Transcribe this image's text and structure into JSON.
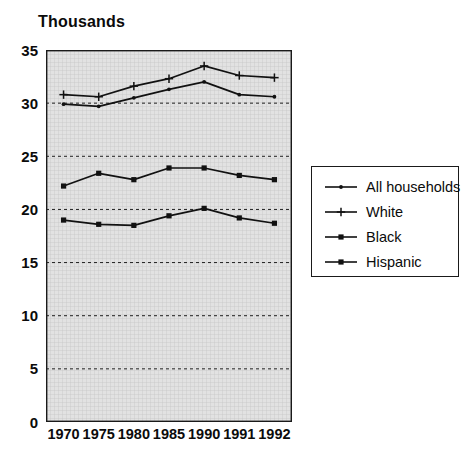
{
  "title": "Thousands",
  "legend": {
    "entries": [
      {
        "label": "All households",
        "marker": "dot-line",
        "color": "#1a1a1a"
      },
      {
        "label": "White",
        "marker": "plus-line",
        "color": "#1a1a1a"
      },
      {
        "label": "Black",
        "marker": "square-line",
        "color": "#1a1a1a"
      },
      {
        "label": "Hispanic",
        "marker": "square-line",
        "color": "#1a1a1a"
      }
    ]
  },
  "chart_data": {
    "type": "line",
    "title": "Thousands",
    "xlabel": "",
    "ylabel": "Thousands",
    "ylim": [
      0,
      35
    ],
    "yticks": [
      0,
      5,
      10,
      15,
      20,
      25,
      30,
      35
    ],
    "grid": true,
    "legend_position": "right",
    "categories": [
      "1970",
      "1975",
      "1980",
      "1985",
      "1990",
      "1991",
      "1992"
    ],
    "series": [
      {
        "name": "All households",
        "marker": "dot",
        "values": [
          29.9,
          29.7,
          30.5,
          31.3,
          32.0,
          30.8,
          30.6
        ]
      },
      {
        "name": "White",
        "marker": "plus",
        "values": [
          30.8,
          30.6,
          31.6,
          32.3,
          33.5,
          32.6,
          32.4
        ]
      },
      {
        "name": "Black",
        "marker": "square",
        "values": [
          19.0,
          18.6,
          18.5,
          19.4,
          20.1,
          19.2,
          18.7
        ]
      },
      {
        "name": "Hispanic",
        "marker": "square",
        "values": [
          22.2,
          23.4,
          22.8,
          23.9,
          23.9,
          23.2,
          22.8
        ]
      }
    ]
  }
}
